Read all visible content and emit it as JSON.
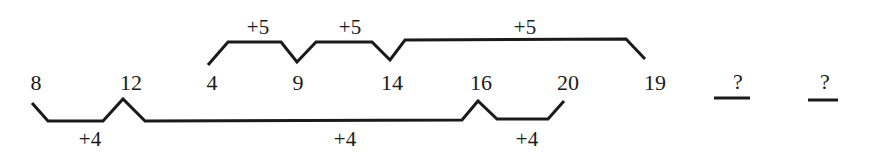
{
  "puzzle": {
    "sequence": [
      {
        "value": "8",
        "x": 36
      },
      {
        "value": "12",
        "x": 131
      },
      {
        "value": "4",
        "x": 212
      },
      {
        "value": "9",
        "x": 298
      },
      {
        "value": "14",
        "x": 392
      },
      {
        "value": "16",
        "x": 481
      },
      {
        "value": "20",
        "x": 568
      },
      {
        "value": "19",
        "x": 655
      },
      {
        "value": "?",
        "x": 738
      },
      {
        "value": "?",
        "x": 825
      }
    ],
    "upper_series": {
      "terms": [
        "4",
        "9",
        "14",
        "19"
      ],
      "step_labels": [
        {
          "text": "+5",
          "x": 258
        },
        {
          "text": "+5",
          "x": 350
        },
        {
          "text": "+5",
          "x": 525
        }
      ]
    },
    "lower_series": {
      "terms": [
        "8",
        "12",
        "16",
        "20"
      ],
      "step_labels": [
        {
          "text": "+4",
          "x": 90
        },
        {
          "text": "+4",
          "x": 345
        },
        {
          "text": "+4",
          "x": 527
        }
      ]
    },
    "blanks": [
      {
        "label": "?",
        "underline_x1": 714,
        "underline_x2": 750
      },
      {
        "label": "?",
        "underline_x1": 808,
        "underline_x2": 838
      }
    ],
    "colors": {
      "ink": "#1a1a1a",
      "background": "#ffffff"
    }
  }
}
